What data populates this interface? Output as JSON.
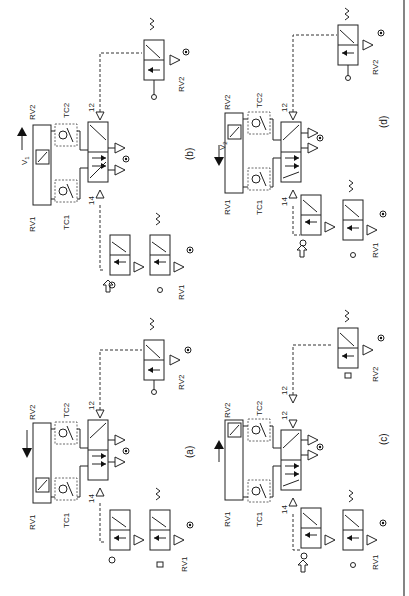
{
  "figure": {
    "orientation": "rotated 90 degrees counter-clockwise",
    "panels": [
      {
        "id": "a",
        "caption": "(a)",
        "cylinder_motion_arrow": "down",
        "velocity_label": "",
        "labels": {
          "rv_top": "RV2",
          "rv_bottom": "RV1",
          "tc_top": "TC2",
          "tc_bottom": "TC1",
          "main_valve_ports": [
            "12",
            "2",
            "1",
            "3",
            "4",
            "5",
            "14"
          ],
          "start_valve_ports": [
            "2",
            "10",
            "1",
            "3",
            "15"
          ],
          "rv1_valve_ports": [
            "2",
            "10",
            "1",
            "3",
            "12"
          ],
          "rv2_valve_ports": [
            "2",
            "10",
            "1",
            "3",
            "12"
          ],
          "rv1_name": "RV1",
          "rv2_name": "RV2"
        }
      },
      {
        "id": "b",
        "caption": "(b)",
        "cylinder_motion_arrow": "up",
        "velocity_label": "V",
        "velocity_sub": "1",
        "labels": {
          "rv_top": "RV2",
          "rv_bottom": "RV1",
          "tc_top": "TC2",
          "tc_bottom": "TC1",
          "main_valve_ports": [
            "12",
            "2",
            "3",
            "1",
            "4",
            "5",
            "14"
          ],
          "start_valve_ports": [
            "2",
            "10",
            "1",
            "3",
            "15"
          ],
          "rv1_valve_ports": [
            "2",
            "10",
            "1",
            "3",
            "12"
          ],
          "rv2_valve_ports": [
            "2",
            "10",
            "1",
            "3",
            "12"
          ],
          "rv1_name": "RV1",
          "rv2_name": "RV2"
        }
      },
      {
        "id": "c",
        "caption": "(c)",
        "cylinder_motion_arrow": "up",
        "velocity_label": "",
        "labels": {
          "rv_top": "RV2",
          "rv_bottom": "RV1",
          "tc_top": "TC2",
          "tc_bottom": "TC1",
          "main_valve_ports": [
            "12",
            "2",
            "1",
            "3",
            "4",
            "5",
            "14"
          ],
          "start_valve_ports": [
            "2",
            "10",
            "1",
            "3",
            "15"
          ],
          "rv1_valve_ports": [
            "2",
            "10",
            "1",
            "3",
            "12"
          ],
          "rv2_valve_ports": [
            "2",
            "10",
            "1",
            "3",
            "12"
          ],
          "extra_pilot_label": "12",
          "rv1_name": "RV1",
          "rv2_name": "RV2"
        }
      },
      {
        "id": "d",
        "caption": "(d)",
        "cylinder_motion_arrow": "down",
        "velocity_label": "V",
        "velocity_sub": "2",
        "labels": {
          "rv_top": "RV2",
          "rv_bottom": "RV1",
          "tc_top": "TC2",
          "tc_bottom": "TC1",
          "main_valve_ports": [
            "12",
            "2",
            "1",
            "3",
            "4",
            "5",
            "14"
          ],
          "start_valve_ports": [
            "2",
            "10",
            "1",
            "3",
            "15"
          ],
          "rv1_valve_ports": [
            "2",
            "10",
            "1",
            "3",
            "12"
          ],
          "rv2_valve_ports": [
            "2",
            "10",
            "1",
            "3",
            "12"
          ],
          "rv1_name": "RV1",
          "rv2_name": "RV2"
        }
      }
    ]
  },
  "colors": {
    "line": "#222222",
    "background": "#ffffff"
  }
}
